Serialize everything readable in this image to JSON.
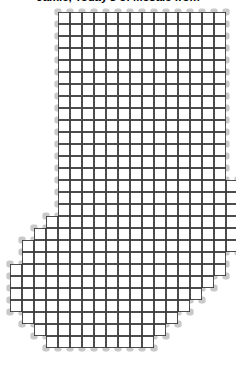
{
  "document": {
    "title": "Jamie, Today's of Mosaic from",
    "kind": "mosaic-grid-pattern"
  },
  "pattern": {
    "name": "stocking-mosaic-grid",
    "cell_size_px": 12,
    "origin_x_px": 10,
    "origin_y_px": 12,
    "grid_columns": 19,
    "grid_rows": 29,
    "cell_fill_color": "#ffffff",
    "grid_line_color": "#3a3a3a",
    "blob_color": "#c9c9c9",
    "background_color": "#ffffff",
    "rows": [
      {
        "index": 0,
        "start_col": 4,
        "end_col": 17
      },
      {
        "index": 1,
        "start_col": 4,
        "end_col": 17
      },
      {
        "index": 2,
        "start_col": 4,
        "end_col": 17
      },
      {
        "index": 3,
        "start_col": 4,
        "end_col": 17
      },
      {
        "index": 4,
        "start_col": 4,
        "end_col": 17
      },
      {
        "index": 5,
        "start_col": 4,
        "end_col": 17
      },
      {
        "index": 6,
        "start_col": 4,
        "end_col": 17
      },
      {
        "index": 7,
        "start_col": 4,
        "end_col": 17
      },
      {
        "index": 8,
        "start_col": 4,
        "end_col": 17
      },
      {
        "index": 9,
        "start_col": 4,
        "end_col": 17
      },
      {
        "index": 10,
        "start_col": 4,
        "end_col": 17
      },
      {
        "index": 11,
        "start_col": 4,
        "end_col": 17
      },
      {
        "index": 12,
        "start_col": 4,
        "end_col": 17
      },
      {
        "index": 13,
        "start_col": 4,
        "end_col": 17
      },
      {
        "index": 14,
        "start_col": 4,
        "end_col": 18
      },
      {
        "index": 15,
        "start_col": 4,
        "end_col": 18
      },
      {
        "index": 16,
        "start_col": 4,
        "end_col": 18
      },
      {
        "index": 17,
        "start_col": 3,
        "end_col": 18
      },
      {
        "index": 18,
        "start_col": 2,
        "end_col": 18
      },
      {
        "index": 19,
        "start_col": 1,
        "end_col": 18
      },
      {
        "index": 20,
        "start_col": 1,
        "end_col": 17
      },
      {
        "index": 21,
        "start_col": 0,
        "end_col": 17
      },
      {
        "index": 22,
        "start_col": 0,
        "end_col": 16
      },
      {
        "index": 23,
        "start_col": 0,
        "end_col": 15
      },
      {
        "index": 24,
        "start_col": 0,
        "end_col": 14
      },
      {
        "index": 25,
        "start_col": 1,
        "end_col": 13
      },
      {
        "index": 26,
        "start_col": 2,
        "end_col": 12
      },
      {
        "index": 27,
        "start_col": 3,
        "end_col": 11
      },
      {
        "index": 28,
        "start_col": 0,
        "end_col": -1
      }
    ]
  }
}
